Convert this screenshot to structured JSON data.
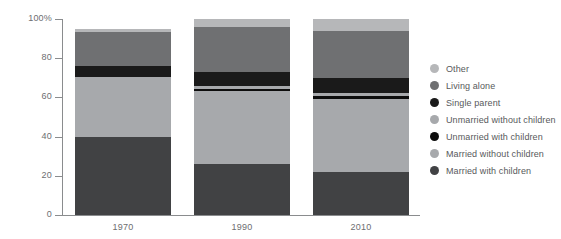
{
  "chart_data": {
    "type": "bar",
    "stacked": true,
    "stacked_mode": "percent",
    "title": "",
    "xlabel": "",
    "ylabel": "",
    "categories": [
      "1970",
      "1990",
      "2010"
    ],
    "ylim": [
      0,
      100
    ],
    "yticks": [
      0,
      20,
      40,
      60,
      80,
      100
    ],
    "ytick_labels": [
      "0",
      "20",
      "40",
      "60",
      "80",
      "100%"
    ],
    "grid": false,
    "legend_position": "right",
    "series": [
      {
        "name": "Other",
        "color": "#b6b7b9",
        "values": [
          1.5,
          4.0,
          6.0
        ]
      },
      {
        "name": "Living alone",
        "color": "#6f7072",
        "values": [
          17.5,
          23.0,
          24.0
        ]
      },
      {
        "name": "Single parent",
        "color": "#1a1a1a",
        "values": [
          5.5,
          7.0,
          8.0
        ]
      },
      {
        "name": "Unmarried without children",
        "color": "#a7a9ac",
        "values": [
          0.0,
          1.5,
          1.5
        ]
      },
      {
        "name": "Unmarried with children",
        "color": "#0d0d0d",
        "values": [
          0.0,
          1.0,
          1.5
        ]
      },
      {
        "name": "Married without children",
        "color": "#a7a9ac",
        "values": [
          30.5,
          37.5,
          37.0
        ]
      },
      {
        "name": "Married with children",
        "color": "#414244",
        "values": [
          40.0,
          26.0,
          22.0
        ]
      }
    ]
  },
  "legend": {
    "items": [
      {
        "label": "Other",
        "color": "#b6b7b9"
      },
      {
        "label": "Living alone",
        "color": "#6f7072"
      },
      {
        "label": "Single parent",
        "color": "#1a1a1a"
      },
      {
        "label": "Unmarried without children",
        "color": "#a7a9ac"
      },
      {
        "label": "Unmarried with children",
        "color": "#0d0d0d"
      },
      {
        "label": "Married without children",
        "color": "#a7a9ac"
      },
      {
        "label": "Married with children",
        "color": "#414244"
      }
    ]
  },
  "colors": {
    "axis": "#8a8c8e",
    "tick_text": "#6d6e71",
    "legend_text": "#58595b",
    "background": "#ffffff"
  }
}
